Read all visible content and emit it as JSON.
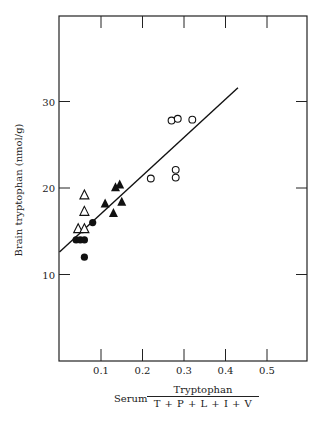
{
  "chart_data": {
    "type": "scatter",
    "title": "",
    "xlabel": "Serum Tryptophan / (T + P + L + I + V)",
    "xlabel_prefix": "Serum",
    "xlabel_numerator": "Tryptophan",
    "xlabel_denominator": "T + P + L + I + V",
    "ylabel": "Brain tryptophan (nmol/g)",
    "xlim": [
      0,
      0.6
    ],
    "ylim": [
      0,
      35
    ],
    "xticks": [
      0.1,
      0.2,
      0.3,
      0.4,
      0.5
    ],
    "xtick_labels": [
      "0.1",
      "0.2",
      "0.3",
      "0.4",
      "0.5"
    ],
    "yticks": [
      10,
      20,
      30
    ],
    "ytick_labels": [
      "10",
      "20",
      "30"
    ],
    "grid": false,
    "legend": null,
    "series": [
      {
        "name": "filled circles",
        "marker": "filled-circle",
        "points": [
          [
            0.04,
            14.0
          ],
          [
            0.05,
            14.0
          ],
          [
            0.06,
            14.0
          ],
          [
            0.06,
            12.0
          ],
          [
            0.08,
            16.0
          ]
        ]
      },
      {
        "name": "open triangles",
        "marker": "open-triangle",
        "points": [
          [
            0.045,
            15.3
          ],
          [
            0.06,
            15.3
          ],
          [
            0.06,
            17.3
          ],
          [
            0.06,
            19.2
          ]
        ]
      },
      {
        "name": "filled triangles",
        "marker": "filled-triangle",
        "points": [
          [
            0.11,
            18.2
          ],
          [
            0.135,
            20.1
          ],
          [
            0.145,
            20.4
          ],
          [
            0.13,
            17.1
          ],
          [
            0.15,
            18.4
          ]
        ]
      },
      {
        "name": "open circles",
        "marker": "open-circle",
        "points": [
          [
            0.22,
            21.1
          ],
          [
            0.27,
            27.8
          ],
          [
            0.285,
            28.0
          ],
          [
            0.32,
            27.9
          ],
          [
            0.28,
            22.1
          ],
          [
            0.28,
            21.2
          ]
        ]
      }
    ],
    "regression_line": {
      "x": [
        0.0,
        0.43
      ],
      "y": [
        12.6,
        31.6
      ]
    }
  }
}
